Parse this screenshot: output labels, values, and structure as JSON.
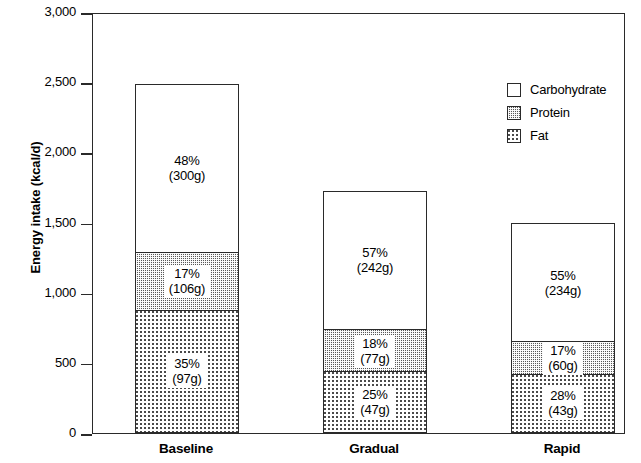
{
  "chart_data": {
    "type": "bar",
    "subtype": "stacked-bar",
    "title": "",
    "xlabel": "",
    "ylabel": "Energy intake (kcal/d)",
    "ylim": [
      0,
      3000
    ],
    "yticks": [
      "0",
      "500",
      "1,000",
      "1,500",
      "2,000",
      "2,500",
      "3,000"
    ],
    "ytick_values": [
      0,
      500,
      1000,
      1500,
      2000,
      2500,
      3000
    ],
    "grid": false,
    "legend_position": "top-right",
    "categories": [
      "Baseline",
      "Gradual",
      "Rapid"
    ],
    "totals": [
      2510,
      1745,
      1515
    ],
    "series": [
      {
        "name": "Fat",
        "pattern": "light-dot",
        "values": [
          880,
          440,
          420
        ],
        "percents": [
          "35%",
          "25%",
          "28%"
        ],
        "grams": [
          "(97g)",
          "(47g)",
          "(43g)"
        ]
      },
      {
        "name": "Protein",
        "pattern": "dark-checker",
        "values": [
          420,
          310,
          245
        ],
        "percents": [
          "17%",
          "18%",
          "17%"
        ],
        "grams": [
          "(106g)",
          "(77g)",
          "(60g)"
        ]
      },
      {
        "name": "Carbohydrate",
        "pattern": "solid-white",
        "values": [
          1210,
          995,
          850
        ],
        "percents": [
          "48%",
          "57%",
          "55%"
        ],
        "grams": [
          "(300g)",
          "(242g)",
          "(234g)"
        ]
      }
    ]
  },
  "axis": {
    "y_title": "Energy intake (kcal/d)",
    "ticks": [
      {
        "label": "3,000",
        "value": 3000
      },
      {
        "label": "2,500",
        "value": 2500
      },
      {
        "label": "2,000",
        "value": 2000
      },
      {
        "label": "1,500",
        "value": 1500
      },
      {
        "label": "1,000",
        "value": 1000
      },
      {
        "label": "500",
        "value": 500
      },
      {
        "label": "0",
        "value": 0
      }
    ]
  },
  "bars": [
    {
      "category": "Baseline",
      "segments": [
        {
          "series": "Carbohydrate",
          "percent": "48%",
          "grams": "(300g)",
          "kcal": 1210
        },
        {
          "series": "Protein",
          "percent": "17%",
          "grams": "(106g)",
          "kcal": 420
        },
        {
          "series": "Fat",
          "percent": "35%",
          "grams": "(97g)",
          "kcal": 880
        }
      ]
    },
    {
      "category": "Gradual",
      "segments": [
        {
          "series": "Carbohydrate",
          "percent": "57%",
          "grams": "(242g)",
          "kcal": 995
        },
        {
          "series": "Protein",
          "percent": "18%",
          "grams": "(77g)",
          "kcal": 310
        },
        {
          "series": "Fat",
          "percent": "25%",
          "grams": "(47g)",
          "kcal": 440
        }
      ]
    },
    {
      "category": "Rapid",
      "segments": [
        {
          "series": "Carbohydrate",
          "percent": "55%",
          "grams": "(234g)",
          "kcal": 850
        },
        {
          "series": "Protein",
          "percent": "17%",
          "grams": "(60g)",
          "kcal": 245
        },
        {
          "series": "Fat",
          "percent": "28%",
          "grams": "(43g)",
          "kcal": 420
        }
      ]
    }
  ],
  "legend": {
    "items": [
      {
        "label": "Carbohydrate",
        "pattern": "solid-white"
      },
      {
        "label": "Protein",
        "pattern": "dark-checker"
      },
      {
        "label": "Fat",
        "pattern": "light-dot"
      }
    ]
  },
  "colors": {
    "axis": "#2a2a2a",
    "protein_fill": "#585858",
    "fat_dot": "#4a4a4a",
    "carb_fill": "#ffffff"
  }
}
